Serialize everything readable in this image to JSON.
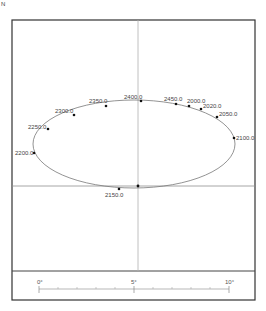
{
  "corner_mark": "N",
  "diagram": {
    "frame": {
      "left": 12,
      "top": 20,
      "right": 255,
      "bottom": 300,
      "divider_y": 271
    },
    "crosshair": {
      "vertical_x": 138,
      "horizontal_y": 186
    },
    "ellipse": {
      "cx": 134,
      "cy": 144,
      "rx": 101,
      "ry": 44
    },
    "points": [
      {
        "label": "2400.0",
        "x": 141,
        "y": 101
      },
      {
        "label": "2350.0",
        "x": 106,
        "y": 106
      },
      {
        "label": "2300.0",
        "x": 74,
        "y": 115
      },
      {
        "label": "2250.0",
        "x": 48,
        "y": 129
      },
      {
        "label": "2200.0",
        "x": 34,
        "y": 153
      },
      {
        "label": "2150.0",
        "x": 119,
        "y": 189
      },
      {
        "label": "2450.0",
        "x": 176,
        "y": 104
      },
      {
        "label": "2000.0",
        "x": 189,
        "y": 106
      },
      {
        "label": "2020.0",
        "x": 201,
        "y": 109
      },
      {
        "label": "2050.0",
        "x": 217,
        "y": 117
      },
      {
        "label": "2100.0",
        "x": 234,
        "y": 138
      }
    ],
    "center_point": {
      "x": 138,
      "y": 186
    }
  },
  "scale_bar": {
    "labels": [
      "0°",
      "5°",
      "10°"
    ],
    "minor_ticks": 10
  },
  "colors": {
    "frame": "#333333",
    "crosshair": "#aaaaaa",
    "ellipse": "#777777",
    "point": "#111111",
    "label": "#444444"
  }
}
